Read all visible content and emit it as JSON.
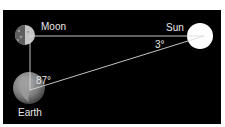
{
  "diagram": {
    "title": "",
    "colors": {
      "background": "#000000",
      "lines": "#d9d9d9",
      "text": "#e8e8e8",
      "sun": "#ffffff",
      "moon_lit": "#c8c8c8",
      "moon_dark": "#6a6a6a",
      "earth": "#8a8a8a"
    },
    "bodies": {
      "moon": {
        "label": "Moon"
      },
      "sun": {
        "label": "Sun"
      },
      "earth": {
        "label": "Earth"
      }
    },
    "angles": {
      "at_sun": "3°",
      "at_earth": "87°"
    }
  }
}
